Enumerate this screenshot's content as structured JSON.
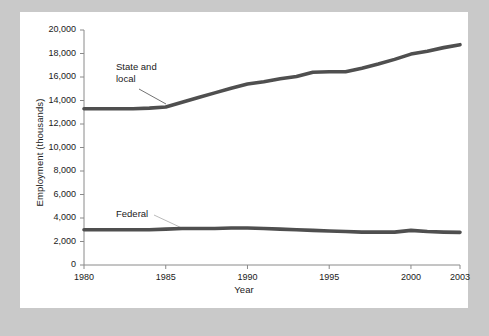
{
  "figure": {
    "background_color": "#c9c9c9",
    "card_color": "#ffffff",
    "line_color": "#4f4f4f",
    "axis_color": "#8a8a8a",
    "text_color": "#1a1a1a"
  },
  "chart_data": {
    "type": "line",
    "title": "",
    "xlabel": "Year",
    "ylabel": "Employment (thousands)",
    "xlim": [
      1980,
      2003
    ],
    "ylim": [
      0,
      20000
    ],
    "xticks": [
      1980,
      1985,
      1990,
      1995,
      2000,
      2003
    ],
    "xtick_labels": [
      "1980",
      "1985",
      "1990",
      "1995",
      "2000",
      "2003"
    ],
    "yticks": [
      0,
      2000,
      4000,
      6000,
      8000,
      10000,
      12000,
      14000,
      16000,
      18000,
      20000
    ],
    "ytick_labels": [
      "0",
      "2,000",
      "4,000",
      "6,000",
      "8,000",
      "10,000",
      "12,000",
      "14,000",
      "16,000",
      "18,000",
      "20,000"
    ],
    "grid": false,
    "legend": "inline-annotations",
    "annotations": [
      {
        "text": "State and\nlocal",
        "series": "State and local"
      },
      {
        "text": "Federal",
        "series": "Federal"
      }
    ],
    "x": [
      1980,
      1981,
      1982,
      1983,
      1984,
      1985,
      1986,
      1987,
      1988,
      1989,
      1990,
      1991,
      1992,
      1993,
      1994,
      1995,
      1996,
      1997,
      1998,
      1999,
      2000,
      2001,
      2002,
      2003
    ],
    "series": [
      {
        "name": "State and local",
        "values": [
          13300,
          13300,
          13300,
          13300,
          13350,
          13450,
          13850,
          14250,
          14650,
          15050,
          15400,
          15600,
          15850,
          16050,
          16400,
          16450,
          16450,
          16750,
          17100,
          17500,
          17950,
          18200,
          18500,
          18750
        ]
      },
      {
        "name": "Federal",
        "values": [
          3000,
          3000,
          3000,
          3000,
          3000,
          3050,
          3100,
          3100,
          3100,
          3150,
          3150,
          3100,
          3050,
          3000,
          2950,
          2900,
          2850,
          2800,
          2800,
          2800,
          2950,
          2850,
          2800,
          2780
        ]
      }
    ]
  }
}
